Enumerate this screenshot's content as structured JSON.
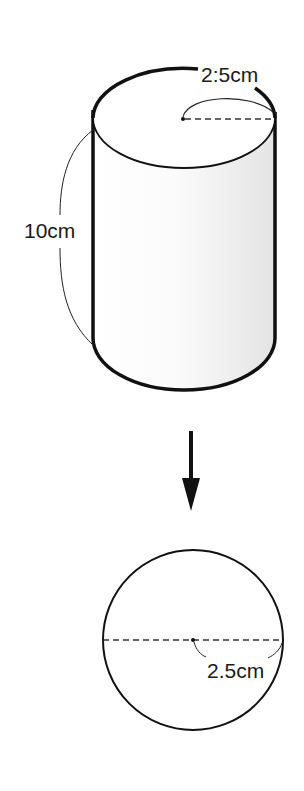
{
  "figure": {
    "type": "geometry-diagram",
    "cylinder": {
      "radius_label": "2:5cm",
      "height_label": "10cm",
      "shading_color": "#e8e8e8"
    },
    "arrow": {
      "direction": "down"
    },
    "sphere": {
      "radius_label": "2.5cm"
    },
    "colors": {
      "stroke": "#111111",
      "background": "#ffffff"
    }
  }
}
